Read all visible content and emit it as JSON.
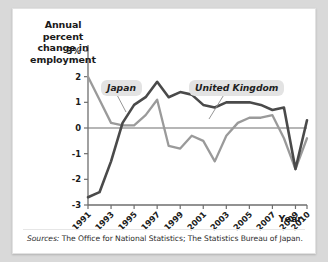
{
  "figure": {
    "y_axis_title": [
      "Annual",
      "percent",
      "change in",
      "employment"
    ],
    "x_axis_title": "Year",
    "sources_prefix": "Sources:",
    "sources_text": " The Office for National Statistics; The Statistics Bureau of Japan.",
    "label_japan": "Japan",
    "label_uk": "United Kingdom",
    "colors": {
      "japan": "#9a9a9a",
      "uk": "#4a4a4a",
      "axis": "#6e6e6e",
      "badge": "#e3e3e3",
      "page": "#ffffff"
    }
  },
  "chart_data": {
    "type": "line",
    "title": "",
    "xlabel": "Year",
    "ylabel": "Annual percent change in employment",
    "ylim": [
      -3,
      3
    ],
    "yticks": [
      3,
      2,
      1,
      0,
      -1,
      -2,
      -3
    ],
    "ytick_labels": [
      "3%",
      "2",
      "1",
      "0",
      "-1",
      "-2",
      "-3"
    ],
    "xlim": [
      1991,
      2010
    ],
    "x": [
      1991,
      1992,
      1993,
      1994,
      1995,
      1996,
      1997,
      1998,
      1999,
      2000,
      2001,
      2002,
      2003,
      2004,
      2005,
      2006,
      2007,
      2008,
      2009,
      2010
    ],
    "xticks": [
      1991,
      1993,
      1995,
      1997,
      1999,
      2001,
      2003,
      2005,
      2007,
      2009,
      2010
    ],
    "xtick_labels": [
      "1991",
      "1993",
      "1995",
      "1997",
      "1999",
      "2001",
      "2003",
      "2005",
      "2007",
      "2009",
      "2010"
    ],
    "grid": false,
    "legend": "inline-labels",
    "series": [
      {
        "name": "Japan",
        "color": "#9a9a9a",
        "values": [
          2.0,
          1.1,
          0.2,
          0.1,
          0.1,
          0.5,
          1.1,
          -0.7,
          -0.8,
          -0.3,
          -0.5,
          -1.3,
          -0.3,
          0.2,
          0.4,
          0.4,
          0.5,
          -0.4,
          -1.6,
          -0.4
        ]
      },
      {
        "name": "United Kingdom",
        "color": "#4a4a4a",
        "values": [
          -2.7,
          -2.5,
          -1.3,
          0.2,
          0.9,
          1.2,
          1.8,
          1.2,
          1.4,
          1.3,
          0.9,
          0.8,
          1.0,
          1.0,
          1.0,
          0.9,
          0.7,
          0.8,
          -1.6,
          0.3
        ]
      }
    ],
    "annotations": [
      {
        "text": "Japan",
        "x": 1992.4,
        "y": 2.25,
        "style": "badge"
      },
      {
        "text": "United Kingdom",
        "x": 1998.2,
        "y": 2.25,
        "style": "badge"
      }
    ]
  }
}
